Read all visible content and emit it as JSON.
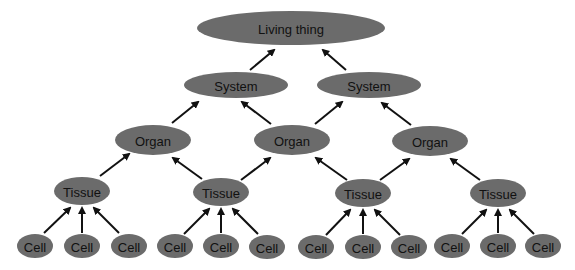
{
  "diagram": {
    "type": "hierarchy",
    "colors": {
      "node_fill": "#6b6b6b",
      "text": "#111111",
      "arrow": "#111111"
    },
    "nodes": [
      {
        "id": "living",
        "label": "Living thing",
        "cx": 291,
        "cy": 28,
        "rx": 94,
        "ry": 17
      },
      {
        "id": "sys1",
        "label": "System",
        "cx": 236,
        "cy": 85,
        "rx": 52,
        "ry": 13
      },
      {
        "id": "sys2",
        "label": "System",
        "cx": 369,
        "cy": 85,
        "rx": 52,
        "ry": 13
      },
      {
        "id": "org1",
        "label": "Organ",
        "cx": 153,
        "cy": 140,
        "rx": 38,
        "ry": 15
      },
      {
        "id": "org2",
        "label": "Organ",
        "cx": 292,
        "cy": 140,
        "rx": 38,
        "ry": 15
      },
      {
        "id": "org3",
        "label": "Organ",
        "cx": 430,
        "cy": 141,
        "rx": 38,
        "ry": 15
      },
      {
        "id": "tis1",
        "label": "Tissue",
        "cx": 82,
        "cy": 191,
        "rx": 28,
        "ry": 14
      },
      {
        "id": "tis2",
        "label": "Tissue",
        "cx": 221,
        "cy": 192,
        "rx": 28,
        "ry": 14
      },
      {
        "id": "tis3",
        "label": "Tissue",
        "cx": 363,
        "cy": 193,
        "rx": 28,
        "ry": 14
      },
      {
        "id": "tis4",
        "label": "Tissue",
        "cx": 498,
        "cy": 193,
        "rx": 28,
        "ry": 14
      },
      {
        "id": "c1",
        "label": "Cell",
        "cx": 35,
        "cy": 246,
        "rx": 18,
        "ry": 12
      },
      {
        "id": "c2",
        "label": "Cell",
        "cx": 82,
        "cy": 246,
        "rx": 18,
        "ry": 12
      },
      {
        "id": "c3",
        "label": "Cell",
        "cx": 129,
        "cy": 246,
        "rx": 18,
        "ry": 12
      },
      {
        "id": "c4",
        "label": "Cell",
        "cx": 175,
        "cy": 246,
        "rx": 18,
        "ry": 12
      },
      {
        "id": "c5",
        "label": "Cell",
        "cx": 221,
        "cy": 246,
        "rx": 18,
        "ry": 12
      },
      {
        "id": "c6",
        "label": "Cell",
        "cx": 267,
        "cy": 247,
        "rx": 18,
        "ry": 12
      },
      {
        "id": "c7",
        "label": "Cell",
        "cx": 316,
        "cy": 247,
        "rx": 18,
        "ry": 12
      },
      {
        "id": "c8",
        "label": "Cell",
        "cx": 363,
        "cy": 247,
        "rx": 18,
        "ry": 12
      },
      {
        "id": "c9",
        "label": "Cell",
        "cx": 409,
        "cy": 247,
        "rx": 18,
        "ry": 12
      },
      {
        "id": "c10",
        "label": "Cell",
        "cx": 452,
        "cy": 246,
        "rx": 18,
        "ry": 12
      },
      {
        "id": "c11",
        "label": "Cell",
        "cx": 498,
        "cy": 246,
        "rx": 18,
        "ry": 12
      },
      {
        "id": "c12",
        "label": "Cell",
        "cx": 543,
        "cy": 246,
        "rx": 18,
        "ry": 12
      }
    ],
    "edges": [
      {
        "from": "sys1",
        "to": "living",
        "x1": 250,
        "y1": 70,
        "x2": 274,
        "y2": 50
      },
      {
        "from": "sys2",
        "to": "living",
        "x1": 346,
        "y1": 70,
        "x2": 323,
        "y2": 50
      },
      {
        "from": "org1",
        "to": "sys1",
        "x1": 172,
        "y1": 123,
        "x2": 198,
        "y2": 102
      },
      {
        "from": "org2",
        "to": "sys1",
        "x1": 271,
        "y1": 124,
        "x2": 242,
        "y2": 102
      },
      {
        "from": "org2",
        "to": "sys2",
        "x1": 315,
        "y1": 124,
        "x2": 342,
        "y2": 102
      },
      {
        "from": "org3",
        "to": "sys2",
        "x1": 411,
        "y1": 125,
        "x2": 382,
        "y2": 103
      },
      {
        "from": "tis1",
        "to": "org1",
        "x1": 100,
        "y1": 176,
        "x2": 129,
        "y2": 154
      },
      {
        "from": "tis2",
        "to": "org1",
        "x1": 202,
        "y1": 179,
        "x2": 173,
        "y2": 158
      },
      {
        "from": "tis2",
        "to": "org2",
        "x1": 241,
        "y1": 180,
        "x2": 270,
        "y2": 158
      },
      {
        "from": "tis3",
        "to": "org2",
        "x1": 347,
        "y1": 180,
        "x2": 316,
        "y2": 158
      },
      {
        "from": "tis3",
        "to": "org3",
        "x1": 380,
        "y1": 180,
        "x2": 409,
        "y2": 159
      },
      {
        "from": "tis4",
        "to": "org3",
        "x1": 480,
        "y1": 180,
        "x2": 451,
        "y2": 159
      },
      {
        "from": "c1",
        "to": "tis1",
        "x1": 44,
        "y1": 233,
        "x2": 70,
        "y2": 208
      },
      {
        "from": "c2",
        "to": "tis1",
        "x1": 82,
        "y1": 233,
        "x2": 82,
        "y2": 208
      },
      {
        "from": "c3",
        "to": "tis1",
        "x1": 119,
        "y1": 233,
        "x2": 94,
        "y2": 208
      },
      {
        "from": "c4",
        "to": "tis2",
        "x1": 184,
        "y1": 234,
        "x2": 209,
        "y2": 209
      },
      {
        "from": "c5",
        "to": "tis2",
        "x1": 221,
        "y1": 233,
        "x2": 221,
        "y2": 209
      },
      {
        "from": "c6",
        "to": "tis2",
        "x1": 258,
        "y1": 234,
        "x2": 233,
        "y2": 209
      },
      {
        "from": "c7",
        "to": "tis3",
        "x1": 326,
        "y1": 235,
        "x2": 350,
        "y2": 210
      },
      {
        "from": "c8",
        "to": "tis3",
        "x1": 363,
        "y1": 234,
        "x2": 363,
        "y2": 210
      },
      {
        "from": "c9",
        "to": "tis3",
        "x1": 400,
        "y1": 235,
        "x2": 375,
        "y2": 210
      },
      {
        "from": "c10",
        "to": "tis4",
        "x1": 462,
        "y1": 234,
        "x2": 486,
        "y2": 210
      },
      {
        "from": "c11",
        "to": "tis4",
        "x1": 498,
        "y1": 233,
        "x2": 498,
        "y2": 210
      },
      {
        "from": "c12",
        "to": "tis4",
        "x1": 534,
        "y1": 234,
        "x2": 510,
        "y2": 210
      }
    ]
  }
}
